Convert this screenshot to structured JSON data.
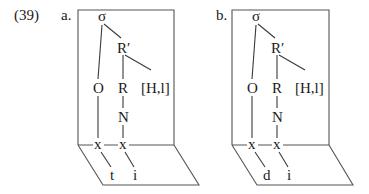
{
  "example_number": "(39)",
  "diagrams": [
    {
      "label": "a.",
      "nodes": {
        "sigma": "σ",
        "r_prime": "R′",
        "onset": "O",
        "rhyme": "R",
        "tone": "[H,l]",
        "nucleus": "N",
        "x1": "x",
        "x2": "x",
        "seg1": "t",
        "seg2": "i"
      }
    },
    {
      "label": "b.",
      "nodes": {
        "sigma": "σ",
        "r_prime": "R′",
        "onset": "O",
        "rhyme": "R",
        "tone": "[H,l]",
        "nucleus": "N",
        "x1": "x",
        "x2": "x",
        "seg1": "d",
        "seg2": "i"
      }
    }
  ],
  "colors": {
    "line": "#3a3a3a",
    "text": "#1a1a1a",
    "background": "#ffffff"
  }
}
